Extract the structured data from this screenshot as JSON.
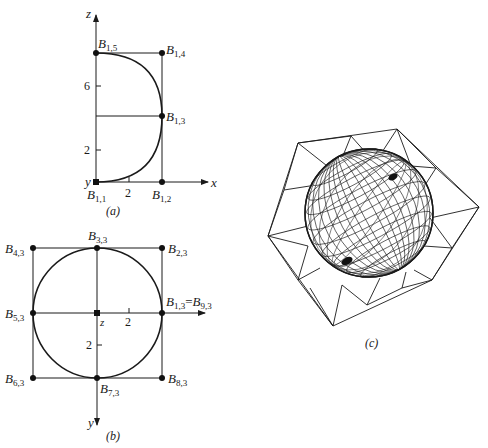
{
  "figure": {
    "panel_a": {
      "caption": "(a)",
      "axes": {
        "z_label": "z",
        "x_label": "x",
        "y_label": "y"
      },
      "ticks": {
        "z": [
          "2",
          "6"
        ],
        "x": [
          "2"
        ]
      },
      "points": [
        {
          "id": "B11",
          "base": "B",
          "sub": "1,1"
        },
        {
          "id": "B12",
          "base": "B",
          "sub": "1,2"
        },
        {
          "id": "B13",
          "base": "B",
          "sub": "1,3"
        },
        {
          "id": "B14",
          "base": "B",
          "sub": "1,4"
        },
        {
          "id": "B15",
          "base": "B",
          "sub": "1,5"
        }
      ]
    },
    "panel_b": {
      "caption": "(b)",
      "axes": {
        "z_label": "z",
        "y_label": "y"
      },
      "ticks": {
        "x": [
          "2"
        ],
        "y": [
          "2"
        ]
      },
      "points": [
        {
          "id": "B13",
          "base": "B",
          "sub": "1,3",
          "equals_base": "B",
          "equals_sub": "9,3",
          "eq": "="
        },
        {
          "id": "B23",
          "base": "B",
          "sub": "2,3"
        },
        {
          "id": "B33",
          "base": "B",
          "sub": "3,3"
        },
        {
          "id": "B43",
          "base": "B",
          "sub": "4,3"
        },
        {
          "id": "B53",
          "base": "B",
          "sub": "5,3"
        },
        {
          "id": "B63",
          "base": "B",
          "sub": "6,3"
        },
        {
          "id": "B73",
          "base": "B",
          "sub": "7,3"
        },
        {
          "id": "B83",
          "base": "B",
          "sub": "8,3"
        }
      ]
    },
    "panel_c": {
      "caption": "(c)",
      "description": "Wireframe sphere inside a triangulated control polygon net"
    },
    "colors": {
      "ink": "#1a1a1a",
      "background": "#ffffff"
    }
  }
}
